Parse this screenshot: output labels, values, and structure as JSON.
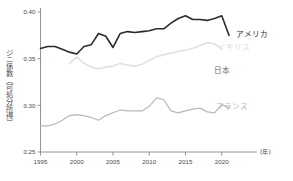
{
  "chart_data": {
    "type": "line",
    "title": "",
    "subtitle": "",
    "xlabel": "(年)",
    "ylabel": "ジニ係数（可処分所得）",
    "xlim": [
      1995,
      2021
    ],
    "ylim": [
      0.25,
      0.4
    ],
    "grid": false,
    "legend_position": "right-inline-labels",
    "x_ticks": [
      "1995",
      "2000",
      "2005",
      "2010",
      "2015",
      "2020"
    ],
    "x_tick_values": [
      1995,
      2000,
      2005,
      2010,
      2015,
      2020
    ],
    "y_ticks": [
      "0.25",
      "0.30",
      "0.35",
      "0.40"
    ],
    "y_tick_values": [
      0.25,
      0.3,
      0.35,
      0.4
    ],
    "x": [
      1995,
      1996,
      1997,
      1998,
      1999,
      2000,
      2001,
      2002,
      2003,
      2004,
      2005,
      2006,
      2007,
      2008,
      2009,
      2010,
      2011,
      2012,
      2013,
      2014,
      2015,
      2016,
      2017,
      2018,
      2019,
      2020,
      2021
    ],
    "series": [
      {
        "name": "アメリカ",
        "label": "アメリカ",
        "color": "#2b2b2b",
        "width": 1.6,
        "label_x": 2021.4,
        "label_y": 0.3755,
        "values": [
          0.361,
          0.363,
          0.363,
          0.36,
          0.357,
          0.355,
          0.363,
          0.365,
          0.377,
          0.374,
          0.362,
          0.377,
          0.379,
          0.378,
          0.379,
          0.38,
          0.382,
          0.382,
          0.388,
          0.393,
          0.396,
          0.392,
          0.392,
          0.391,
          0.393,
          0.396,
          0.375
        ]
      },
      {
        "name": "イギリス",
        "label": "イギリス",
        "color": "#e2e2e2",
        "width": 1.7,
        "label_x": 2018.9,
        "label_y": 0.3625,
        "values": [
          null,
          null,
          null,
          null,
          0.345,
          0.352,
          0.345,
          0.341,
          0.339,
          0.341,
          0.342,
          0.345,
          0.343,
          0.342,
          0.344,
          0.348,
          0.352,
          0.354,
          0.356,
          0.358,
          0.359,
          0.361,
          0.364,
          0.367,
          0.366,
          0.36,
          null
        ]
      },
      {
        "name": "日本",
        "label": "日本",
        "color": "#6d6d6d",
        "width": 1.0,
        "label_x": 2018.4,
        "label_y": 0.3372,
        "values": [
          0.323,
          null,
          null,
          0.331,
          null,
          0.337,
          null,
          null,
          0.321,
          null,
          null,
          0.329,
          null,
          null,
          0.336,
          null,
          null,
          0.337,
          null,
          null,
          0.337,
          null,
          null,
          0.337,
          null,
          null,
          null
        ]
      },
      {
        "name": "フランス",
        "label": "フランス",
        "color": "#b8b8b8",
        "width": 1.2,
        "label_x": 2018.6,
        "label_y": 0.2985,
        "values": [
          0.278,
          0.278,
          0.28,
          0.284,
          0.289,
          0.29,
          0.289,
          0.287,
          0.284,
          0.289,
          0.292,
          0.295,
          0.294,
          0.294,
          0.294,
          0.299,
          0.308,
          0.306,
          0.294,
          0.292,
          0.294,
          0.296,
          0.297,
          0.293,
          0.292,
          0.301,
          0.297
        ]
      }
    ],
    "caption": ""
  },
  "axis": {
    "x_unit_label": "(年)",
    "y_axis_title": "ジニ係数（可処分所得）"
  }
}
